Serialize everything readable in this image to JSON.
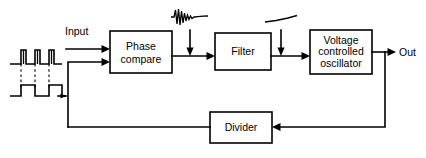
{
  "diagram": {
    "background_color": "#ffffff",
    "line_color": "#000000",
    "blocks": [
      {
        "id": "phase_compare",
        "label_line1": "Phase",
        "label_line2": "compare",
        "label_line3": ""
      },
      {
        "id": "filter",
        "label_line1": "Filter",
        "label_line2": "",
        "label_line3": ""
      },
      {
        "id": "vco",
        "label_line1": "Voltage",
        "label_line2": "controlled",
        "label_line3": "oscillator"
      },
      {
        "id": "divider",
        "label_line1": "Divider",
        "label_line2": "",
        "label_line3": ""
      }
    ],
    "labels": {
      "input": "Input",
      "output": "Out"
    },
    "annotations": [
      {
        "id": "input-waveform",
        "name": "pulse-train-waveform",
        "description": "narrow pulse train aligned above square wave"
      },
      {
        "id": "input-waveform-2",
        "name": "square-wave-waveform",
        "description": "square wave feedback reference"
      },
      {
        "id": "phase-detector-output-waveform",
        "name": "noisy-ringing-waveform",
        "description": "ringing error signal at phase comparator output"
      },
      {
        "id": "filter-output-waveform",
        "name": "smooth-dc-waveform",
        "description": "smoothed slowly varying control voltage after filter"
      }
    ]
  }
}
